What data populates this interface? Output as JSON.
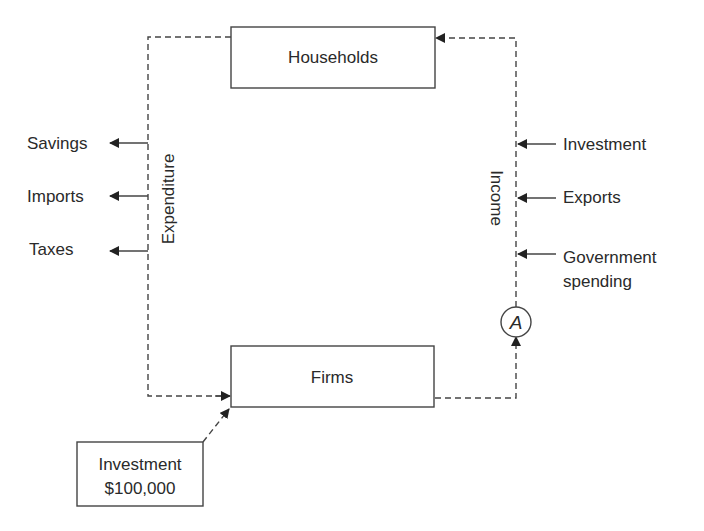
{
  "diagram": {
    "nodes": {
      "households": "Households",
      "firms": "Firms",
      "investment_box": {
        "line1": "Investment",
        "line2": "$100,000"
      },
      "point_a": "A"
    },
    "flow_labels": {
      "expenditure": "Expenditure",
      "income": "Income"
    },
    "leakages": [
      "Savings",
      "Imports",
      "Taxes"
    ],
    "injections": [
      {
        "line1": "Investment",
        "line2": ""
      },
      {
        "line1": "Exports",
        "line2": ""
      },
      {
        "line1": "Government",
        "line2": "spending"
      }
    ]
  }
}
